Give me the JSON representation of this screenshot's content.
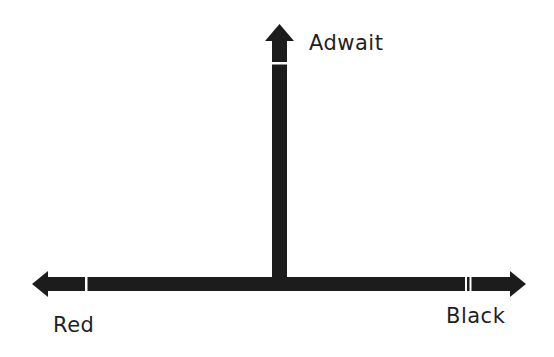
{
  "diagram": {
    "type": "axis-arrows",
    "colors": {
      "arrow": "#1c1c1c",
      "background": "#ffffff",
      "text": "#1f1f1f"
    },
    "axes": {
      "vertical": {
        "direction": "up",
        "label": "Adwait"
      },
      "horizontal_left": {
        "direction": "left",
        "label": "Red"
      },
      "horizontal_right": {
        "direction": "right",
        "label": "Black"
      }
    }
  }
}
